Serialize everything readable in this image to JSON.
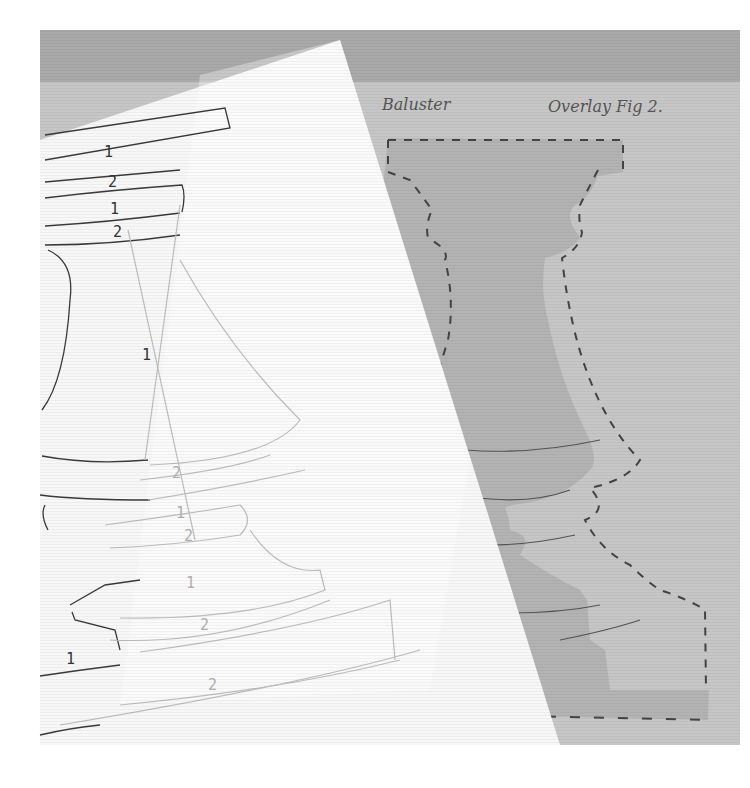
{
  "photo": {
    "description": "Photograph of a baluster quilting/appliqué pattern on white paper partially overlapping a grey overlay template sheet",
    "colors": {
      "background": "#ffffff",
      "top_band": "#a9a9a9",
      "grey_sheet": "#c6c6c6",
      "baluster_fill": "#b3b3b3",
      "white_paper": "#f7f7f7",
      "pencil": "#333333",
      "faint_pencil": "#bdbdbd",
      "dashed_outline": "#444444"
    }
  },
  "annotations": {
    "title": "Baluster",
    "subtitle": "Overlay Fig 2."
  },
  "pattern_labels": {
    "top_bands": [
      "1",
      "2",
      "1",
      "2"
    ],
    "body": "1",
    "lower": [
      "2",
      "1",
      "2",
      "1",
      "2"
    ],
    "base_left": "1",
    "base": "2"
  }
}
